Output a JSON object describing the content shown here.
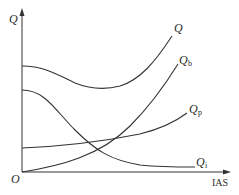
{
  "diagram": {
    "axes": {
      "y_label": "Q",
      "x_label": "IAS",
      "origin_label": "O"
    },
    "curves": [
      {
        "id": "Q",
        "label": "Q",
        "subscript": "",
        "description": "total (sum) curve, U-shaped: decreases then increases"
      },
      {
        "id": "Qb",
        "label": "Q",
        "subscript": "b",
        "description": "rises steeply from origin"
      },
      {
        "id": "Qp",
        "label": "Q",
        "subscript": "p",
        "description": "starts above origin, rises gently"
      },
      {
        "id": "Qi",
        "label": "Q",
        "subscript": "i",
        "description": "starts high, decreases and levels off"
      }
    ],
    "colors": {
      "line": "#333333",
      "background": "#ffffff"
    }
  }
}
